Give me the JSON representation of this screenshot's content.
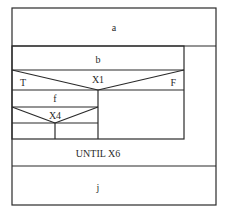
{
  "diagram": {
    "type": "nassi-shneiderman",
    "blocks": {
      "a": "a",
      "b": "b",
      "decision1": {
        "condition": "X1",
        "true_label": "T",
        "false_label": "F"
      },
      "f": "f",
      "decision2": {
        "condition": "X4"
      },
      "loop_condition": "UNTIL X6",
      "j": "j"
    },
    "colors": {
      "line": "#2a2a2a",
      "background": "#ffffff"
    }
  }
}
